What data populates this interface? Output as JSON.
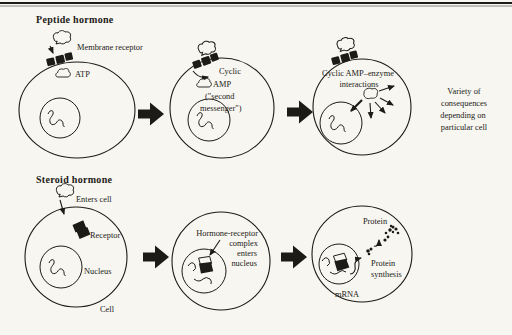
{
  "figure": {
    "colors": {
      "ink": "#1d1b17",
      "paper": "#f7f6f1"
    },
    "peptide": {
      "title": "Peptide hormone",
      "membrane_receptor_label": "Membrane receptor",
      "atp_label": "ATP",
      "cyclic_amp_lines": {
        "l1": "Cyclic",
        "l2": "AMP",
        "l3": "(\"second",
        "l4": "messenger\")"
      },
      "enzyme_lines": {
        "l1": "Cyclic AMP–enzyme",
        "l2": "interactions"
      },
      "outcome_lines": {
        "l1": "Variety of",
        "l2": "consequences",
        "l3": "depending on",
        "l4": "particular cell"
      }
    },
    "steroid": {
      "title": "Steroid hormone",
      "enters_cell_label": "Enters cell",
      "receptor_label": "Receptor",
      "nucleus_label": "Nucleus",
      "cell_label": "Cell",
      "complex_lines": {
        "l1": "Hormone-receptor",
        "l2": "complex",
        "l3": "enters",
        "l4": "nucleus"
      },
      "protein_label": "Protein",
      "protein_synthesis_lines": {
        "l1": "Protein",
        "l2": "synthesis"
      },
      "mrna_label": "mRNA"
    }
  }
}
